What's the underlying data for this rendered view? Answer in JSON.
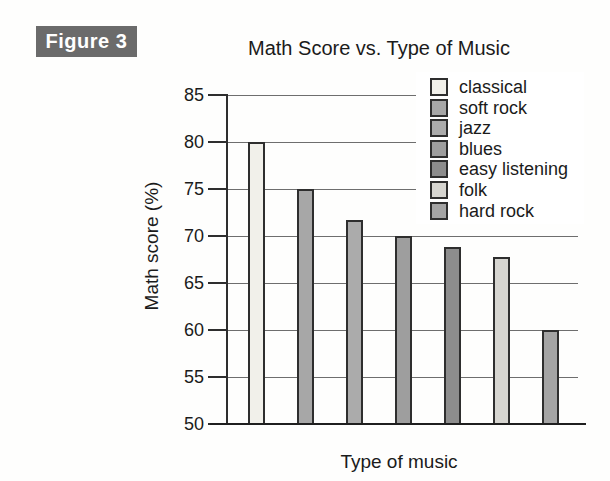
{
  "figure_label": "Figure 3",
  "colors": {
    "figure_badge_bg": "#6b6b6b",
    "figure_badge_text": "#ffffff",
    "axis": "#2e2e2e",
    "grid": "#6e6e6e",
    "text": "#1b1b1b",
    "background": "#ffffff"
  },
  "chart_data": {
    "type": "bar",
    "title": "Math Score vs. Type of Music",
    "xlabel": "Type of music",
    "ylabel": "Math score (%)",
    "ylim": [
      50,
      85
    ],
    "yticks": [
      50,
      55,
      60,
      65,
      70,
      75,
      80,
      85
    ],
    "grid": true,
    "legend_position": "top-right",
    "categories": [
      "classical",
      "soft rock",
      "jazz",
      "blues",
      "easy listening",
      "folk",
      "hard rock"
    ],
    "values": [
      80,
      75,
      71.7,
      70,
      68.8,
      67.8,
      60
    ],
    "bar_colors": [
      "#f1f0ea",
      "#a7a7a7",
      "#ababab",
      "#9e9e9e",
      "#8d8d8d",
      "#d6d5d0",
      "#a4a4a4"
    ],
    "bar_border_color": "#2e2e2e"
  }
}
